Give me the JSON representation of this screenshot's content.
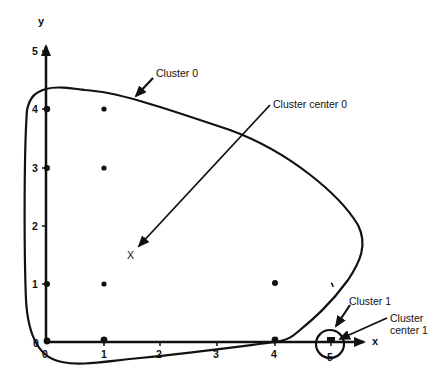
{
  "diagram": {
    "type": "cluster-scatter",
    "axes": {
      "x_label": "x",
      "y_label": "y",
      "x_ticks": [
        "0",
        "1",
        "2",
        "3",
        "4",
        "5"
      ],
      "y_ticks": [
        "0",
        "1",
        "2",
        "3",
        "4",
        "5"
      ]
    },
    "points": [
      {
        "x": 0,
        "y": 4
      },
      {
        "x": 1,
        "y": 4
      },
      {
        "x": 0,
        "y": 3
      },
      {
        "x": 1,
        "y": 3
      },
      {
        "x": 0,
        "y": 1
      },
      {
        "x": 1,
        "y": 1
      },
      {
        "x": 0,
        "y": 0
      },
      {
        "x": 1,
        "y": 0
      },
      {
        "x": 4,
        "y": 1
      },
      {
        "x": 4,
        "y": 0
      },
      {
        "x": 5,
        "y": 0
      }
    ],
    "centers": [
      {
        "label": "Cluster center 0",
        "marker": "X",
        "x": 1.5,
        "y": 1.6
      },
      {
        "label": "Cluster center 1",
        "marker": "x",
        "x": 5,
        "y": 0
      }
    ],
    "annotations": {
      "cluster0": "Cluster 0",
      "center0": "Cluster center 0",
      "cluster1": "Cluster 1",
      "center1_line1": "Cluster",
      "center1_line2": "center 1",
      "center0_marker": "X"
    },
    "colors": {
      "ink": "#111111",
      "background": "#ffffff"
    }
  }
}
